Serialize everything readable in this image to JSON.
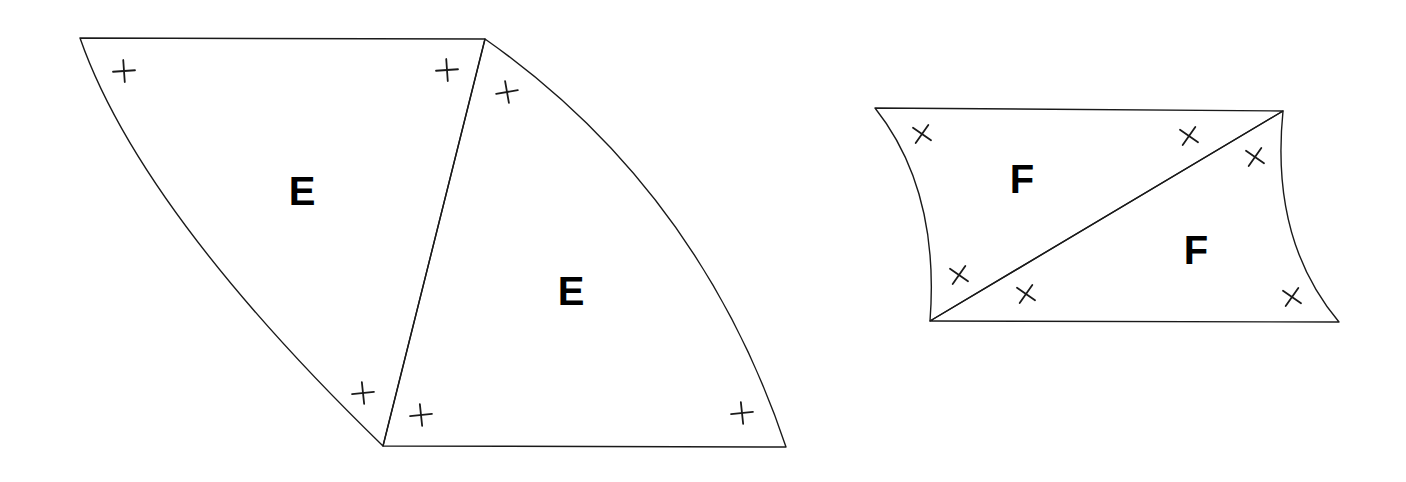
{
  "diagram": {
    "colors": {
      "stroke": "#1a1a1a",
      "label": "#000000",
      "background": "#ffffff"
    },
    "pieces": [
      {
        "id": "E1",
        "label": "E",
        "label_pos": [
          302,
          205
        ],
        "marks": "plus"
      },
      {
        "id": "E2",
        "label": "E",
        "label_pos": [
          571,
          305
        ],
        "marks": "plus"
      },
      {
        "id": "F1",
        "label": "F",
        "label_pos": [
          1022,
          193
        ],
        "marks": "cross"
      },
      {
        "id": "F2",
        "label": "F",
        "label_pos": [
          1196,
          264
        ],
        "marks": "cross"
      }
    ]
  }
}
